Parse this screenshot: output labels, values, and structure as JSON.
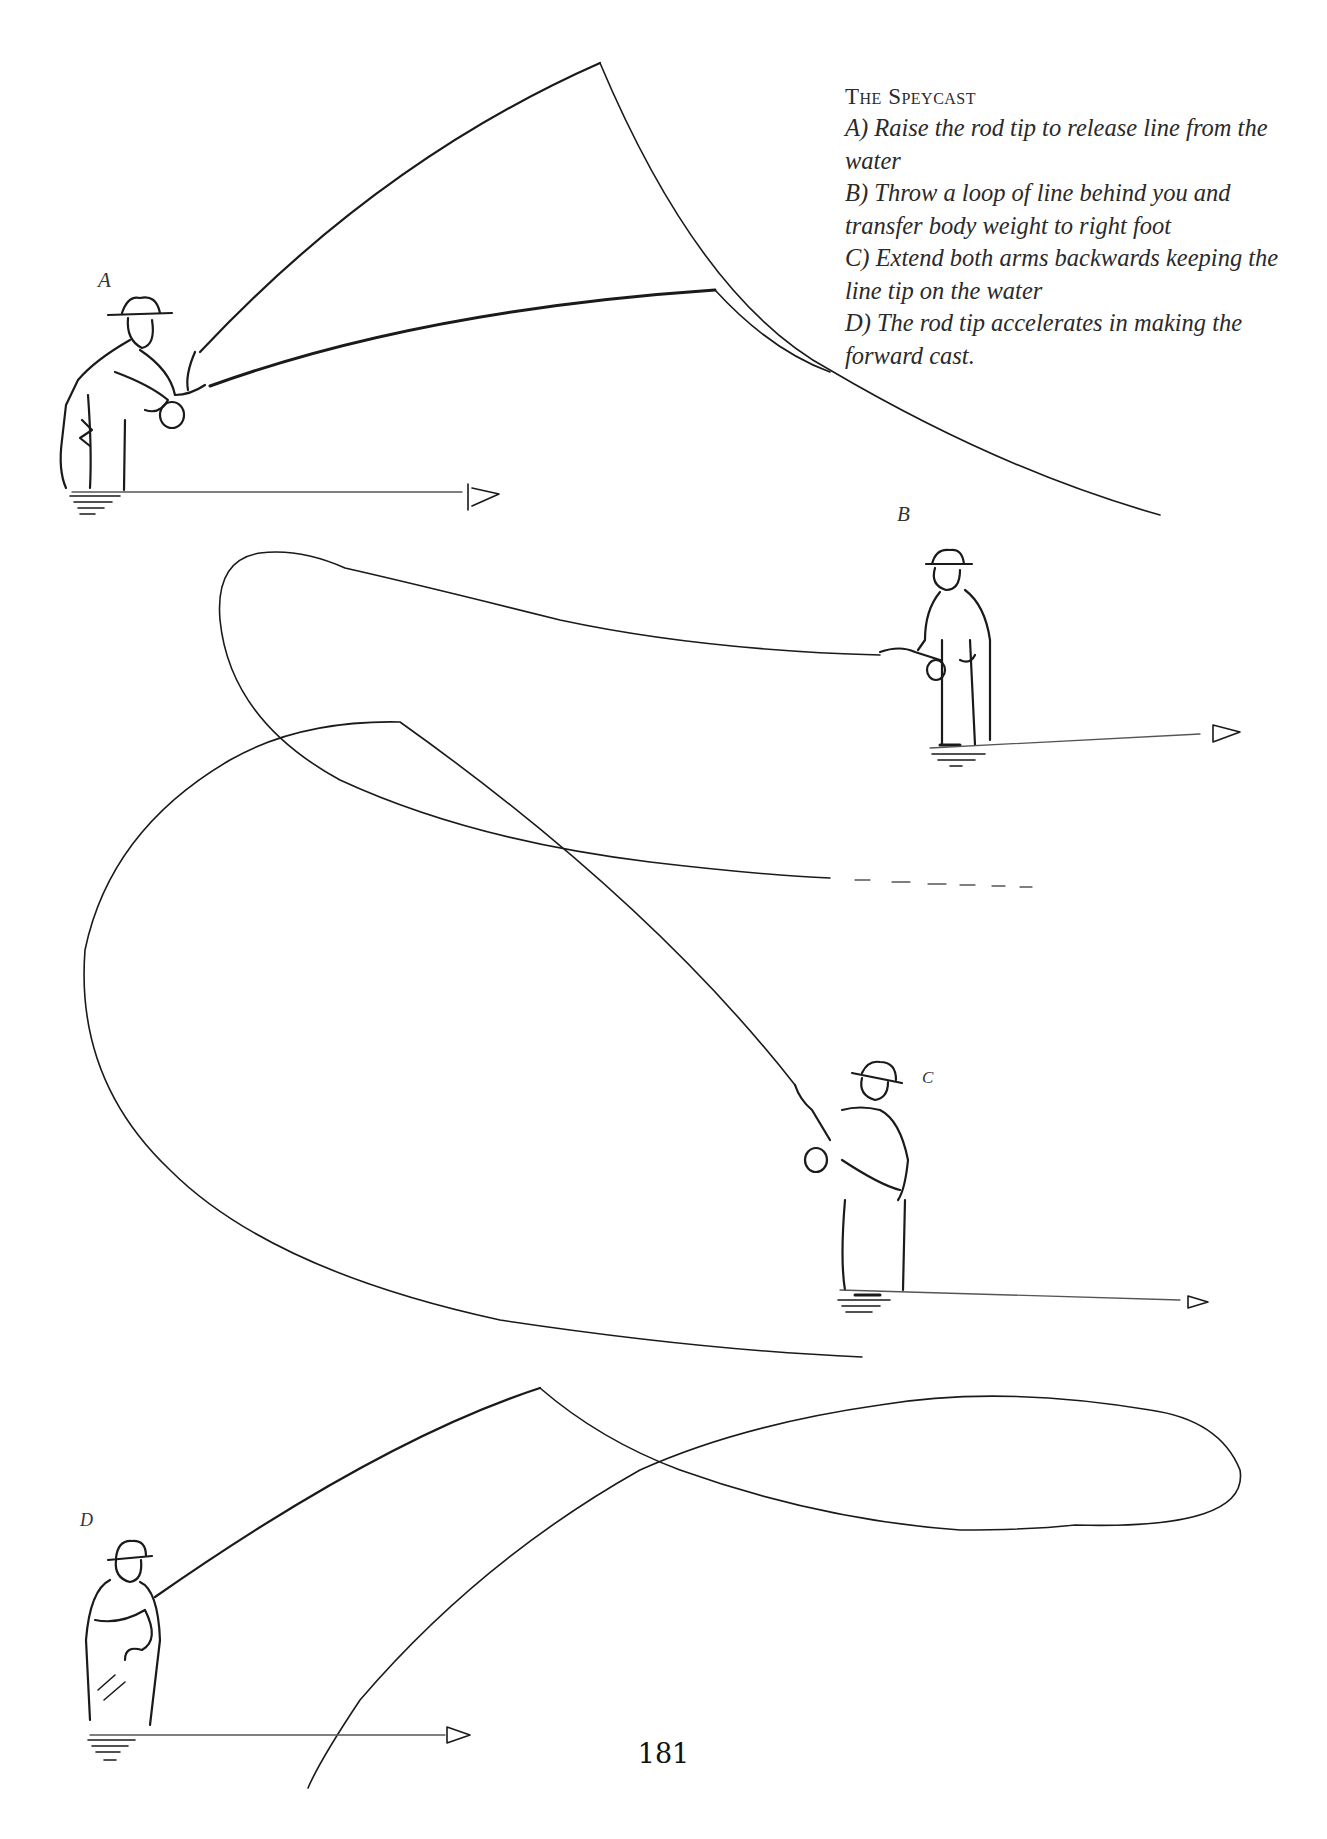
{
  "page": {
    "number": "181"
  },
  "caption": {
    "title": "The Speycast",
    "steps": [
      {
        "id": "A",
        "text": "A) Raise the rod tip to release line from the water"
      },
      {
        "id": "B",
        "text": "B) Throw a loop of line behind you and transfer body weight to right foot"
      },
      {
        "id": "C",
        "text": "C) Extend both arms backwards keeping the line tip on the water"
      },
      {
        "id": "D",
        "text": "D) The rod tip accelerates in making the forward cast."
      }
    ]
  },
  "figures": [
    {
      "label": "A",
      "description": "angler in waders raising rod tip, line lifting from water, arrow pointing right along water"
    },
    {
      "label": "B",
      "description": "angler throwing loop of line behind, arrow pointing right along water"
    },
    {
      "label": "C",
      "description": "angler extending arms backward with large D-loop of line, arrow pointing right"
    },
    {
      "label": "D",
      "description": "angler making forward cast, rod tip accelerating, arrow pointing right"
    }
  ]
}
